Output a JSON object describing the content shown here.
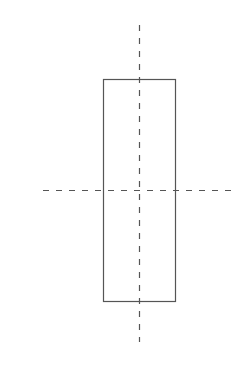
{
  "diagram": {
    "canvas": {
      "width": 247,
      "height": 368,
      "background": "#ffffff"
    },
    "stroke_color": "#555555",
    "rectangle": {
      "x": 103,
      "y": 79,
      "width": 72,
      "height": 222
    },
    "vertical_axis": {
      "x": 139,
      "y1": 25,
      "y2": 342,
      "dash": "6,7"
    },
    "horizontal_axis": {
      "y": 190,
      "x1": 43,
      "x2": 235,
      "dash": "6,7"
    }
  }
}
